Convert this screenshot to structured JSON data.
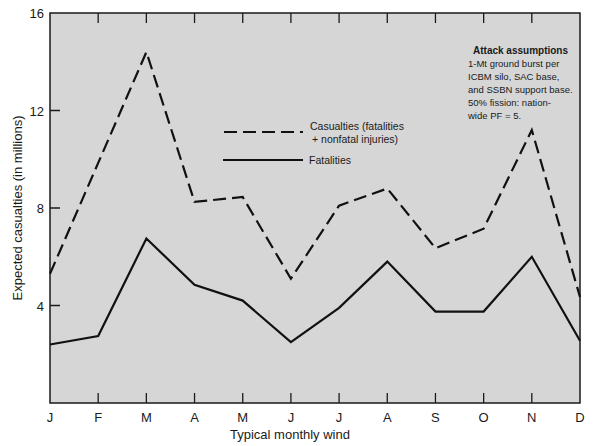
{
  "chart_data": {
    "type": "line",
    "title": "",
    "xlabel": "Typical monthly wind",
    "ylabel": "Expected casualties (in millions)",
    "categories": [
      "J",
      "F",
      "M",
      "A",
      "M",
      "J",
      "J",
      "A",
      "S",
      "O",
      "N",
      "D"
    ],
    "yticks": [
      4,
      8,
      12,
      16
    ],
    "ylim": [
      0,
      16
    ],
    "grid": false,
    "legend_position": "upper center inside plot",
    "series": [
      {
        "name": "Casualties (fatalities + nonfatal injuries)",
        "style": "dashed",
        "values": [
          5.3,
          9.85,
          14.4,
          8.25,
          8.45,
          5.1,
          8.1,
          8.8,
          6.35,
          7.15,
          11.2,
          4.35
        ]
      },
      {
        "name": "Fatalities",
        "style": "solid",
        "values": [
          2.4,
          2.75,
          6.75,
          4.85,
          4.2,
          2.5,
          3.9,
          5.8,
          3.75,
          3.75,
          6.0,
          2.55
        ]
      }
    ],
    "annotations": [
      {
        "title": "Attack assumptions",
        "lines": [
          "1-Mt ground burst per",
          "ICBM silo, SAC base,",
          "and SSBN support base.",
          "50% fission: nation-",
          "wide PF = 5."
        ]
      }
    ]
  },
  "legend": {
    "casualties_line1": "Casualties (fatalities",
    "casualties_line2": "+ nonfatal injuries)",
    "fatalities": "Fatalities"
  },
  "note": {
    "title": "Attack assumptions",
    "lines": [
      "1-Mt ground burst per",
      "ICBM silo, SAC base,",
      "and SSBN support base.",
      "50% fission: nation-",
      "wide PF = 5."
    ]
  },
  "colors": {
    "plot_background": "#d6d6d6",
    "line": "#111111",
    "frame": "#1a1a1a"
  }
}
